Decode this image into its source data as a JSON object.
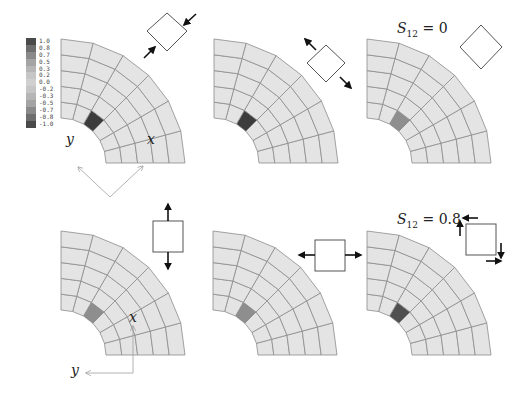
{
  "legend": {
    "values": [
      "1.0",
      "0.8",
      "0.7",
      "0.5",
      "0.3",
      "0.2",
      "0.0",
      "-0.2",
      "-0.3",
      "-0.5",
      "-0.7",
      "-0.8",
      "-1.0"
    ],
    "colors": [
      "#4a4a4a",
      "#6e6e6e",
      "#8a8a8a",
      "#a4a4a4",
      "#b6b6b6",
      "#c6c6c6",
      "#d0d0d0",
      "#c6c6c6",
      "#b6b6b6",
      "#a4a4a4",
      "#8a8a8a",
      "#6e6e6e",
      "#4a4a4a"
    ]
  },
  "mesh": {
    "radial_divisions": 6,
    "angular_divisions": 6,
    "fill": "#e4e4e4",
    "line": "#8c8c8c"
  },
  "panels": [
    {
      "id": "p1",
      "origin": [
        61,
        163
      ],
      "highlight_color": "#3c3c3c",
      "stress_icon": "compression-diagonal"
    },
    {
      "id": "p2",
      "origin": [
        214,
        163
      ],
      "highlight_color": "#3c3c3c",
      "stress_icon": "tension-diagonal"
    },
    {
      "id": "p3",
      "origin": [
        367,
        163
      ],
      "highlight_color": "#8e8e8e",
      "stress_icon": "no-load-diamond"
    },
    {
      "id": "p4",
      "origin": [
        61,
        355
      ],
      "highlight_color": "#8e8e8e",
      "stress_icon": "tension-vertical"
    },
    {
      "id": "p5",
      "origin": [
        213,
        355
      ],
      "highlight_color": "#8e8e8e",
      "stress_icon": "tension-horizontal"
    },
    {
      "id": "p6",
      "origin": [
        367,
        355
      ],
      "highlight_color": "#505050",
      "stress_icon": "pure-shear"
    }
  ],
  "annotations": {
    "s12_zero": {
      "symbol": "S",
      "subscript": "12",
      "rest": " = 0"
    },
    "s12_point8": {
      "symbol": "S",
      "subscript": "12",
      "rest": " = 0.8"
    },
    "x_label": "x",
    "y_label": "y"
  }
}
